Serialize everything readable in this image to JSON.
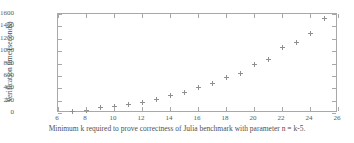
{
  "chart_data": {
    "type": "scatter",
    "title": "",
    "xlabel": "Minimum k required to prove correctness of Julia benchmark with parameter n = k-5.",
    "ylabel": "Verification time (seconds)",
    "xlim": [
      6,
      26
    ],
    "ylim": [
      0,
      1600
    ],
    "xticks": [
      6,
      8,
      10,
      12,
      14,
      16,
      18,
      20,
      22,
      24,
      26
    ],
    "yticks": [
      0,
      200,
      400,
      600,
      800,
      1000,
      1200,
      1400,
      1600
    ],
    "grid": false,
    "legend": null,
    "marker": "plus",
    "marker_color": "#8f8f8f",
    "axis_color": "#a8a8a8",
    "background": "#ffffff",
    "x": [
      7,
      8,
      9,
      10,
      11,
      12,
      13,
      14,
      15,
      16,
      17,
      18,
      19,
      20,
      21,
      22,
      23,
      24,
      25
    ],
    "values": [
      20,
      45,
      85,
      105,
      130,
      170,
      215,
      280,
      330,
      405,
      470,
      570,
      640,
      780,
      870,
      1055,
      1145,
      1290,
      1520
    ],
    "points": [
      {
        "k": 7,
        "seconds": 20
      },
      {
        "k": 8,
        "seconds": 45
      },
      {
        "k": 9,
        "seconds": 85
      },
      {
        "k": 10,
        "seconds": 105
      },
      {
        "k": 11,
        "seconds": 130
      },
      {
        "k": 12,
        "seconds": 170
      },
      {
        "k": 13,
        "seconds": 215
      },
      {
        "k": 14,
        "seconds": 280
      },
      {
        "k": 15,
        "seconds": 330
      },
      {
        "k": 16,
        "seconds": 405
      },
      {
        "k": 17,
        "seconds": 470
      },
      {
        "k": 18,
        "seconds": 570
      },
      {
        "k": 19,
        "seconds": 640
      },
      {
        "k": 20,
        "seconds": 780
      },
      {
        "k": 21,
        "seconds": 870
      },
      {
        "k": 22,
        "seconds": 1055
      },
      {
        "k": 23,
        "seconds": 1145
      },
      {
        "k": 24,
        "seconds": 1290
      },
      {
        "k": 25,
        "seconds": 1520
      }
    ]
  }
}
